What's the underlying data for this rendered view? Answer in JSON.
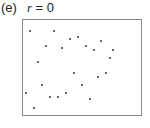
{
  "panel": {
    "letter": "(e)",
    "r_symbol": "r",
    "equals": " = 0"
  },
  "chart_data": {
    "type": "scatter",
    "xlabel": "",
    "ylabel": "",
    "grid": false,
    "legend": null,
    "frame": {
      "x": 22.5,
      "y": 19.5,
      "width": 119,
      "height": 96
    },
    "points_px": [
      [
        30,
        31
      ],
      [
        54,
        31
      ],
      [
        70,
        39
      ],
      [
        78,
        37
      ],
      [
        101,
        41
      ],
      [
        46,
        46
      ],
      [
        62,
        48
      ],
      [
        86,
        46
      ],
      [
        94,
        50
      ],
      [
        113,
        50
      ],
      [
        110,
        58
      ],
      [
        38,
        62
      ],
      [
        74,
        73
      ],
      [
        106,
        73
      ],
      [
        98,
        77
      ],
      [
        42,
        85
      ],
      [
        82,
        85
      ],
      [
        26,
        93
      ],
      [
        66,
        93
      ],
      [
        50,
        97
      ],
      [
        58,
        97
      ],
      [
        90,
        99
      ],
      [
        34,
        108
      ]
    ],
    "correlation": 0
  }
}
